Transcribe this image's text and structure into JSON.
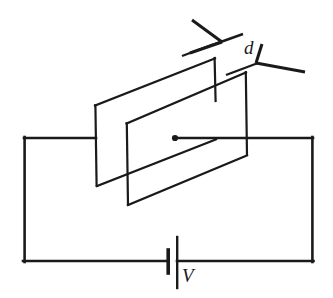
{
  "figure": {
    "type": "circuit-diagram",
    "background_color": "#ffffff",
    "ink_color": "#1a1a1a"
  },
  "labels": {
    "separation": "d",
    "voltage": "V"
  },
  "components": {
    "back_plate": {
      "name": "back-capacitor-plate",
      "shape": "parallelogram",
      "points": "95,105 215,58 215,140 97,186"
    },
    "front_plate": {
      "name": "front-capacitor-plate",
      "shape": "parallelogram",
      "points": "127,123 247,72 247,155 128,205"
    },
    "battery": {
      "name": "battery-cell",
      "long_plate_x": 176,
      "short_plate_x": 168,
      "baseline_y": 262
    },
    "circuit_loop": {
      "left_x": 24,
      "right_x": 313,
      "top_y": 138,
      "bottom_y": 262
    },
    "junction_dot": {
      "cx": 175,
      "cy": 138,
      "r": 3.1
    }
  },
  "dimension_marker": {
    "name": "plate-separation-marker",
    "label": "d",
    "upper_arrow_tip": "219,43",
    "lower_arrow_tip": "261,62"
  }
}
